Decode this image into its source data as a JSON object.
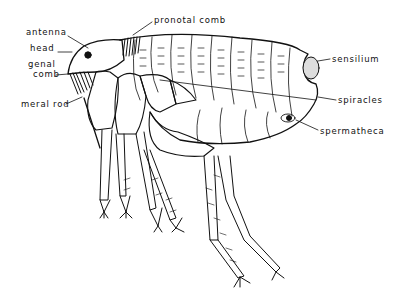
{
  "diagram": {
    "labels": [
      {
        "id": "antenna",
        "text": "antenna",
        "x": 26,
        "y": 32
      },
      {
        "id": "head",
        "text": "head",
        "x": 30,
        "y": 48
      },
      {
        "id": "genal-comb-1",
        "text": "genal",
        "x": 28,
        "y": 62
      },
      {
        "id": "genal-comb-2",
        "text": "comb",
        "x": 33,
        "y": 72
      },
      {
        "id": "meral-rod",
        "text": "meral rod",
        "x": 21,
        "y": 101
      },
      {
        "id": "pronotal-comb",
        "text": "pronotal   comb",
        "x": 154,
        "y": 17
      },
      {
        "id": "sensilium",
        "text": "sensilium",
        "x": 332,
        "y": 56
      },
      {
        "id": "spiracles",
        "text": "spiracles",
        "x": 338,
        "y": 97
      },
      {
        "id": "spermatheca",
        "text": "spermatheca",
        "x": 320,
        "y": 128
      }
    ]
  }
}
